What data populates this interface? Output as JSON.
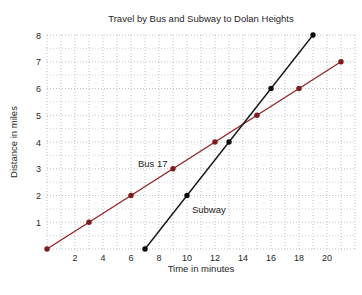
{
  "title": "Travel by Bus and Subway to Dolan Heights",
  "chart_data": {
    "type": "line",
    "title": "Travel by Bus and Subway to Dolan Heights",
    "xlabel": "Time in minutes",
    "ylabel": "Distance in miles",
    "xlim": [
      0,
      22
    ],
    "ylim": [
      0,
      8
    ],
    "x_ticks": [
      2,
      4,
      6,
      8,
      10,
      12,
      14,
      16,
      18,
      20
    ],
    "y_ticks": [
      1,
      2,
      3,
      4,
      5,
      6,
      7,
      8
    ],
    "grid": {
      "style": "dotted",
      "x_step_minutes": 1,
      "y_step_miles": 0.5,
      "major_color": "#b2b2b2",
      "minor_color": "#cccccc"
    },
    "legend_position": "inline-annotations",
    "series": [
      {
        "name": "Bus 17",
        "color": "#952626",
        "marker_color": "#7d1c1c",
        "slope_miles_per_minute": 0.3333,
        "points": [
          [
            0,
            0
          ],
          [
            3,
            1
          ],
          [
            6,
            2
          ],
          [
            9,
            3
          ],
          [
            12,
            4
          ],
          [
            15,
            5
          ],
          [
            18,
            6
          ],
          [
            21,
            7
          ]
        ]
      },
      {
        "name": "Subway",
        "color": "#151515",
        "marker_color": "#0a0a0a",
        "slope_miles_per_minute": 0.6667,
        "points": [
          [
            7,
            0
          ],
          [
            10,
            2
          ],
          [
            13,
            4
          ],
          [
            16,
            6
          ],
          [
            19,
            8
          ]
        ]
      }
    ],
    "annotations": [
      {
        "text": "Bus 17",
        "x": 6.5,
        "y": 3.05,
        "series": "Bus 17"
      },
      {
        "text": "Subway",
        "x": 10.35,
        "y": 1.33,
        "series": "Subway"
      }
    ]
  }
}
